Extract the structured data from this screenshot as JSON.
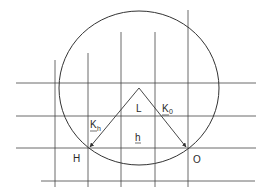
{
  "diagram": {
    "type": "ewald-sphere-construction",
    "stroke_color": "#333333",
    "circle": {
      "cx": 139,
      "cy": 88,
      "rx": 80,
      "ry": 77
    },
    "horizontal_lines": [
      {
        "y": 83,
        "x1": 16,
        "x2": 256
      },
      {
        "y": 116,
        "x1": 16,
        "x2": 256
      },
      {
        "y": 148,
        "x1": 16,
        "x2": 256
      },
      {
        "y": 181,
        "x1": 41,
        "x2": 255
      }
    ],
    "vertical_lines": [
      {
        "x": 55,
        "y1": 60,
        "y2": 187
      },
      {
        "x": 88,
        "y1": 53,
        "y2": 187
      },
      {
        "x": 121,
        "y1": 32,
        "y2": 187
      },
      {
        "x": 155,
        "y1": 32,
        "y2": 187
      },
      {
        "x": 188,
        "y1": 10,
        "y2": 187
      }
    ],
    "vectors": [
      {
        "name": "K_h",
        "from": [
          139,
          88
        ],
        "to": [
          89,
          148
        ]
      },
      {
        "name": "K_0",
        "from": [
          139,
          88
        ],
        "to": [
          187,
          148
        ]
      }
    ],
    "labels": {
      "L": "L",
      "K_h_main": "K",
      "K_h_sub": "h",
      "K_0_main": "K",
      "K_0_sub": "0",
      "h": "h",
      "H": "H",
      "O": "O"
    }
  }
}
